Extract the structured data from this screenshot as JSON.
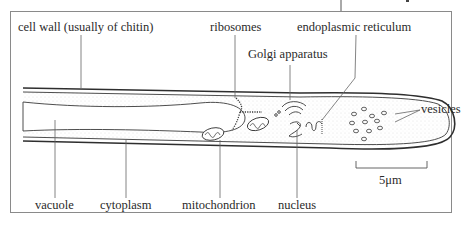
{
  "diagram": {
    "labels": {
      "cell_wall": "cell wall (usually of chitin)",
      "ribosomes": "ribosomes",
      "endoplasmic_reticulum": "endoplasmic reticulum",
      "golgi": "Golgi apparatus",
      "vesicles": "vesicles",
      "vacuole": "vacuole",
      "cytoplasm": "cytoplasm",
      "mitochondrion": "mitochondrion",
      "nucleus": "nucleus",
      "scale_bar": "5μm"
    },
    "colors": {
      "line": "#3a3a3a",
      "frame": "#8a8a8a",
      "cytoplasm_stipple": "#c8c8c8"
    }
  }
}
